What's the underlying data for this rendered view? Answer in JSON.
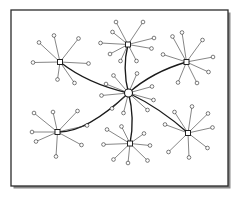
{
  "figure": {
    "kind": "network-topology-diagram",
    "title": "",
    "caption": "",
    "width": 238,
    "height": 200,
    "background_color": "#ffffff"
  },
  "frame": {
    "name": "figure-border",
    "x": 11,
    "y": 10,
    "width": 217,
    "height": 176,
    "stroke_color": "#2b2b2b",
    "stroke_width": 1.3,
    "fill_color": "#ffffff",
    "shadow": {
      "enabled": true,
      "color": "#8a8a8a",
      "offset_x": 2.5,
      "offset_y": 2.5,
      "thickness": 2.5
    }
  },
  "style": {
    "backbone_stroke_color": "#1a1a1a",
    "backbone_stroke_width": 1.35,
    "spoke_stroke_color": "#3a3a3a",
    "spoke_stroke_width": 0.62,
    "leaf_node_shape": "circle",
    "leaf_node_radius": 1.85,
    "leaf_node_fill": "#ffffff",
    "leaf_node_stroke": "#2e2e2e",
    "leaf_node_stroke_width": 0.62,
    "hub_node_shape": "square",
    "hub_node_size": 5.0,
    "hub_node_fill": "#ffffff",
    "hub_node_stroke": "#1a1a1a",
    "hub_node_stroke_width": 0.95,
    "core_node_shape": "circle",
    "core_node_radius": 4.0,
    "core_node_fill": "#ffffff",
    "core_node_stroke": "#1a1a1a",
    "core_node_stroke_width": 1.1
  },
  "counts": {
    "core_nodes": 1,
    "hub_nodes": 6,
    "leaf_nodes": 45,
    "backbone_edges": 6,
    "spoke_edges": 45,
    "total_nodes": 52
  },
  "core": {
    "id": "core",
    "label": "core-hub",
    "x": 128.5,
    "y": 93.0,
    "degree": 10,
    "leaves": [
      {
        "id": "c-l1",
        "x": 106.0,
        "y": 84.0
      },
      {
        "id": "c-l2",
        "x": 101.5,
        "y": 95.5
      },
      {
        "id": "c-l3",
        "x": 112.0,
        "y": 108.5
      },
      {
        "id": "c-l4",
        "x": 123.5,
        "y": 113.0
      },
      {
        "id": "c-l5",
        "x": 147.5,
        "y": 110.0
      },
      {
        "id": "c-l6",
        "x": 153.5,
        "y": 100.0
      },
      {
        "id": "c-l7",
        "x": 152.0,
        "y": 86.5
      },
      {
        "id": "c-l8",
        "x": 137.0,
        "y": 73.5
      },
      {
        "id": "c-l9",
        "x": 113.5,
        "y": 75.5
      }
    ]
  },
  "hubs": [
    {
      "id": "hub-top-left",
      "label": "top-left-hub",
      "x": 60.0,
      "y": 62.0,
      "backbone_curve": {
        "cx": 88.0,
        "cy": 84.0
      },
      "leaves": [
        {
          "id": "tl-l1",
          "x": 33.0,
          "y": 62.5
        },
        {
          "id": "tl-l2",
          "x": 39.0,
          "y": 42.5
        },
        {
          "id": "tl-l3",
          "x": 54.0,
          "y": 35.5
        },
        {
          "id": "tl-l4",
          "x": 78.5,
          "y": 38.5
        },
        {
          "id": "tl-l5",
          "x": 88.5,
          "y": 63.5
        },
        {
          "id": "tl-l6",
          "x": 74.5,
          "y": 83.0
        },
        {
          "id": "tl-l7",
          "x": 57.5,
          "y": 79.5
        }
      ]
    },
    {
      "id": "hub-top-center",
      "label": "top-center-hub",
      "x": 128.0,
      "y": 44.5,
      "backbone_curve": {
        "cx": 122.0,
        "cy": 68.0
      },
      "leaves": [
        {
          "id": "tc-l1",
          "x": 100.5,
          "y": 43.0
        },
        {
          "id": "tc-l2",
          "x": 112.5,
          "y": 32.0
        },
        {
          "id": "tc-l3",
          "x": 116.0,
          "y": 22.0
        },
        {
          "id": "tc-l4",
          "x": 143.0,
          "y": 22.0
        },
        {
          "id": "tc-l5",
          "x": 154.0,
          "y": 38.0
        },
        {
          "id": "tc-l6",
          "x": 151.5,
          "y": 48.5
        },
        {
          "id": "tc-l7",
          "x": 136.5,
          "y": 61.0
        },
        {
          "id": "tc-l8",
          "x": 120.5,
          "y": 61.0
        },
        {
          "id": "tc-l9",
          "x": 110.0,
          "y": 54.0
        }
      ]
    },
    {
      "id": "hub-top-right",
      "label": "top-right-hub",
      "x": 186.5,
      "y": 62.0,
      "backbone_curve": {
        "cx": 152.0,
        "cy": 72.0
      },
      "leaves": [
        {
          "id": "tr-l1",
          "x": 163.0,
          "y": 54.5
        },
        {
          "id": "tr-l2",
          "x": 172.5,
          "y": 36.5
        },
        {
          "id": "tr-l3",
          "x": 182.0,
          "y": 32.5
        },
        {
          "id": "tr-l4",
          "x": 202.5,
          "y": 40.0
        },
        {
          "id": "tr-l5",
          "x": 213.0,
          "y": 57.0
        },
        {
          "id": "tr-l6",
          "x": 208.5,
          "y": 72.0
        },
        {
          "id": "tr-l7",
          "x": 197.0,
          "y": 83.0
        },
        {
          "id": "tr-l8",
          "x": 178.0,
          "y": 82.5
        }
      ]
    },
    {
      "id": "hub-bottom-left",
      "label": "bottom-left-hub",
      "x": 57.5,
      "y": 132.0,
      "backbone_curve": {
        "cx": 86.0,
        "cy": 133.0
      },
      "leaves": [
        {
          "id": "bl-l1",
          "x": 32.0,
          "y": 132.0
        },
        {
          "id": "bl-l2",
          "x": 34.0,
          "y": 113.0
        },
        {
          "id": "bl-l3",
          "x": 53.0,
          "y": 112.0
        },
        {
          "id": "bl-l4",
          "x": 77.5,
          "y": 111.0
        },
        {
          "id": "bl-l5",
          "x": 87.0,
          "y": 125.5
        },
        {
          "id": "bl-l6",
          "x": 81.5,
          "y": 145.0
        },
        {
          "id": "bl-l7",
          "x": 56.0,
          "y": 156.5
        },
        {
          "id": "bl-l8",
          "x": 36.0,
          "y": 141.5
        }
      ]
    },
    {
      "id": "hub-bottom-center",
      "label": "bottom-center-hub",
      "x": 130.0,
      "y": 143.5,
      "backbone_curve": {
        "cx": 135.0,
        "cy": 118.0
      },
      "leaves": [
        {
          "id": "bc-l1",
          "x": 103.5,
          "y": 144.5
        },
        {
          "id": "bc-l2",
          "x": 107.0,
          "y": 129.5
        },
        {
          "id": "bc-l3",
          "x": 121.5,
          "y": 126.5
        },
        {
          "id": "bc-l4",
          "x": 144.0,
          "y": 133.5
        },
        {
          "id": "bc-l5",
          "x": 150.0,
          "y": 145.5
        },
        {
          "id": "bc-l6",
          "x": 147.5,
          "y": 160.5
        },
        {
          "id": "bc-l7",
          "x": 128.0,
          "y": 163.0
        },
        {
          "id": "bc-l8",
          "x": 113.5,
          "y": 159.5
        }
      ]
    },
    {
      "id": "hub-bottom-right",
      "label": "bottom-right-hub",
      "x": 188.0,
      "y": 133.0,
      "backbone_curve": {
        "cx": 160.0,
        "cy": 108.0
      },
      "leaves": [
        {
          "id": "br-l1",
          "x": 165.0,
          "y": 124.5
        },
        {
          "id": "br-l2",
          "x": 174.5,
          "y": 112.0
        },
        {
          "id": "br-l3",
          "x": 192.0,
          "y": 106.5
        },
        {
          "id": "br-l4",
          "x": 208.0,
          "y": 113.5
        },
        {
          "id": "br-l5",
          "x": 212.5,
          "y": 127.5
        },
        {
          "id": "br-l6",
          "x": 207.5,
          "y": 148.0
        },
        {
          "id": "br-l7",
          "x": 189.0,
          "y": 157.5
        },
        {
          "id": "br-l8",
          "x": 168.5,
          "y": 152.0
        }
      ]
    }
  ]
}
